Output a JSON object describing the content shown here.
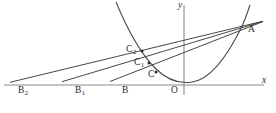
{
  "figure": {
    "background_color": "#ffffff",
    "width": 276,
    "height": 113,
    "axes": {
      "x_axis_label": "x",
      "y_axis_label": "y",
      "origin_label": "O",
      "x_axis_y_pixel": 85,
      "y_axis_x_pixel": 184,
      "axis_color": "#8a8a8a"
    },
    "curve": {
      "name": "parabola",
      "color": "#4a4a4a",
      "vertex_label": "",
      "description": "upward-opening parabola with vertex just right of the origin"
    },
    "points": [
      {
        "id": "B2",
        "label": "B",
        "subscript": "2",
        "x": 33,
        "y": 85,
        "marker": false,
        "on": "x-axis"
      },
      {
        "id": "B1",
        "label": "B",
        "subscript": "1",
        "x": 90,
        "y": 85,
        "marker": false,
        "on": "x-axis"
      },
      {
        "id": "B",
        "label": "B",
        "subscript": "",
        "x": 132,
        "y": 85,
        "marker": false,
        "on": "x-axis"
      },
      {
        "id": "O",
        "label": "O",
        "subscript": "",
        "x": 184,
        "y": 85,
        "marker": false,
        "on": "origin"
      },
      {
        "id": "C2",
        "label": "C",
        "subscript": "2",
        "x": 142,
        "y": 51,
        "marker": true,
        "on": "parabola"
      },
      {
        "id": "C1",
        "label": "C",
        "subscript": "1",
        "x": 149,
        "y": 63,
        "marker": true,
        "on": "parabola"
      },
      {
        "id": "C",
        "label": "C",
        "subscript": "",
        "x": 156,
        "y": 72,
        "marker": true,
        "on": "parabola"
      },
      {
        "id": "A",
        "label": "A",
        "subscript": "",
        "x": 243,
        "y": 24,
        "marker": false,
        "on": "parabola"
      }
    ],
    "lines": [
      {
        "id": "secant-B2-A",
        "from": "B2",
        "through": "C2",
        "to": "A",
        "color": "#3d3d3d"
      },
      {
        "id": "secant-B1-A",
        "from": "B1",
        "through": "C1",
        "to": "A",
        "color": "#3d3d3d"
      },
      {
        "id": "secant-B-A",
        "from": "B",
        "through": "C",
        "to": "A",
        "color": "#3d3d3d"
      }
    ],
    "labels": {
      "B2": "B",
      "B2_sub": "2",
      "B1": "B",
      "B1_sub": "1",
      "B": "B",
      "O": "O",
      "C2": "C",
      "C2_sub": "2",
      "C1": "C",
      "C1_sub": "1",
      "C": "C",
      "A": "A",
      "x": "x",
      "y": "y"
    }
  }
}
